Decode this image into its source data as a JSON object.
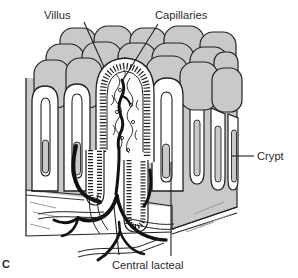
{
  "palette": {
    "bg": "#ffffff",
    "gray": "#c9c9c9",
    "line": "#222222",
    "vessel": "#111111",
    "hatch": "#9a9a9a",
    "text": "#2b2b2b"
  },
  "figure": {
    "panel_letter": "C",
    "labels": {
      "villus": "Villus",
      "capillaries": "Capillaries",
      "crypt": "Crypt",
      "central_lacteal": "Central lacteal"
    }
  }
}
